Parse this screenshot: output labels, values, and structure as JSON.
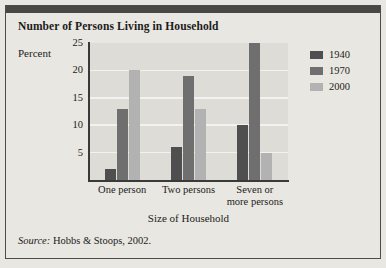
{
  "figure": {
    "title": "Number of Persons Living in Household",
    "source_prefix": "Source:",
    "source_text": "Hobbs & Stoops, 2002."
  },
  "colors": {
    "page_background": "#e9e7e1",
    "plot_background": "#dedcd6",
    "gridline": "#f3f2ee",
    "axis": "#3a3a38",
    "top_bar": "#4a4844",
    "series_1940": "#4f4f4f",
    "series_1970": "#6f6f6f",
    "series_2000": "#b2b2b2"
  },
  "chart_data": {
    "type": "bar",
    "title": "Number of Persons Living in Household",
    "xlabel": "Size of Household",
    "ylabel": "Percent",
    "categories": [
      "One person",
      "Two persons",
      "Seven or more persons"
    ],
    "category_lines": [
      [
        "One person"
      ],
      [
        "Two persons"
      ],
      [
        "Seven or",
        "more persons"
      ]
    ],
    "series": [
      {
        "name": "1940",
        "color": "#4f4f4f",
        "values": [
          2,
          6,
          10
        ]
      },
      {
        "name": "1970",
        "color": "#6f6f6f",
        "values": [
          13,
          19,
          25
        ]
      },
      {
        "name": "2000",
        "color": "#b2b2b2",
        "values": [
          20,
          13,
          5
        ]
      }
    ],
    "ylim": [
      0,
      25
    ],
    "yticks": [
      5,
      10,
      15,
      20,
      25
    ],
    "ytick_labels": [
      "5",
      "10",
      "15",
      "20",
      "25"
    ],
    "grid": true,
    "legend_position": "right"
  }
}
